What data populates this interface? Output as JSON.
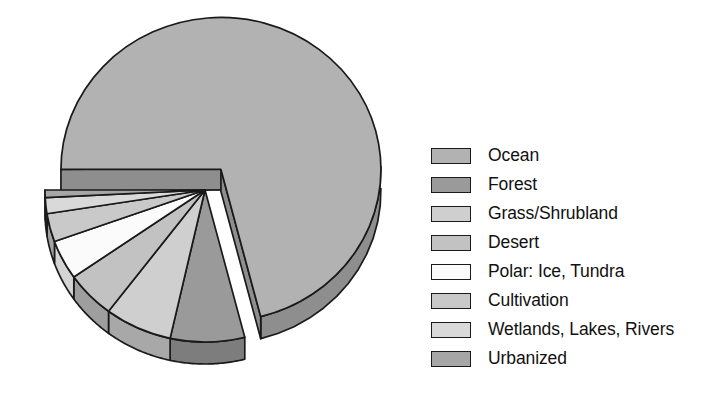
{
  "chart_data": {
    "type": "pie",
    "title": "",
    "subtitle": "",
    "xlabel": "",
    "ylabel": "",
    "legend_position": "right",
    "grid": false,
    "style": "3d-exploded-pie",
    "exploded_slice": "Ocean",
    "start_angle_deg": 180,
    "direction": "clockwise",
    "categories": [
      "Ocean",
      "Forest",
      "Grass/Shrubland",
      "Desert",
      "Polar: Ice, Tundra",
      "Cultivation",
      "Wetlands, Lakes, Rivers",
      "Urbanized"
    ],
    "values": [
      71.0,
      7.5,
      6.8,
      5.0,
      4.2,
      3.0,
      1.7,
      0.8
    ],
    "unit": "percent of Earth surface",
    "slices": [
      {
        "label": "Ocean",
        "value": 71.0,
        "color": "#b2b2b2",
        "side_color": "#8e8e8e",
        "exploded": true
      },
      {
        "label": "Forest",
        "value": 7.5,
        "color": "#9a9a9a",
        "side_color": "#7d7d7d",
        "exploded": false
      },
      {
        "label": "Grass/Shrubland",
        "value": 6.8,
        "color": "#cfcfcf",
        "side_color": "#a8a8a8",
        "exploded": false
      },
      {
        "label": "Desert",
        "value": 5.0,
        "color": "#c2c2c2",
        "side_color": "#9e9e9e",
        "exploded": false
      },
      {
        "label": "Polar: Ice, Tundra",
        "value": 4.2,
        "color": "#fbfbfb",
        "side_color": "#d4d4d4",
        "exploded": false
      },
      {
        "label": "Cultivation",
        "value": 3.0,
        "color": "#c9c9c9",
        "side_color": "#a3a3a3",
        "exploded": false
      },
      {
        "label": "Wetlands, Lakes, Rivers",
        "value": 1.7,
        "color": "#d9d9d9",
        "side_color": "#b0b0b0",
        "exploded": false
      },
      {
        "label": "Urbanized",
        "value": 0.8,
        "color": "#a6a6a6",
        "side_color": "#868686",
        "exploded": false
      }
    ]
  },
  "legend": {
    "items": [
      {
        "label": "Ocean",
        "color": "#b2b2b2"
      },
      {
        "label": "Forest",
        "color": "#9a9a9a"
      },
      {
        "label": "Grass/Shrubland",
        "color": "#cfcfcf"
      },
      {
        "label": "Desert",
        "color": "#c2c2c2"
      },
      {
        "label": "Polar: Ice, Tundra",
        "color": "#fbfbfb"
      },
      {
        "label": "Cultivation",
        "color": "#c9c9c9"
      },
      {
        "label": "Wetlands, Lakes, Rivers",
        "color": "#d9d9d9"
      },
      {
        "label": "Urbanized",
        "color": "#a6a6a6"
      }
    ]
  },
  "colors": {
    "background": "#ffffff",
    "outline": "#1a1a1a",
    "text": "#111111"
  }
}
